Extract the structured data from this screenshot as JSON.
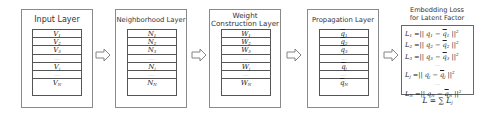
{
  "layers": [
    {
      "title": "Input Layer",
      "rows": [
        "V1",
        "V2",
        "V3",
        "...",
        "Vj",
        "...",
        "VN"
      ]
    },
    {
      "title": "Neighborhood Layer",
      "rows": [
        "N1",
        "N2",
        "N3",
        "...",
        "Nj",
        "...",
        "NN"
      ]
    },
    {
      "title": "Weight Construction Layer",
      "title_line1": "Weight",
      "title_line2": "Construction Layer",
      "rows": [
        "W1",
        "W2",
        "W3",
        "...",
        "Wj",
        "...",
        "WN"
      ]
    },
    {
      "title": "Propagation Layer",
      "rows": [
        "q̄1",
        "q̄2",
        "q̄3",
        "...",
        "q̄j",
        "...",
        "q̄N"
      ]
    }
  ],
  "loss": {
    "title_line1": "Embedding Loss",
    "title_line2": "for Latent Factor",
    "equations": [
      "L1 = || q1 − q̄1 ||²",
      "L2 = || q2 − q̄2 ||²",
      "L3 = || q3 − q̄3 ||²",
      "...",
      "Lj = || qj − q̄j ||²",
      "...",
      "LN = || qN − q̄N ||²"
    ],
    "total": "L = Σ Lj"
  },
  "glyphs": {
    "dots": "⋯",
    "bar": "¯"
  },
  "arrows": 4,
  "colors": {
    "border": "#8a8a8a",
    "table_border": "#555555",
    "arrow": "#777777"
  }
}
